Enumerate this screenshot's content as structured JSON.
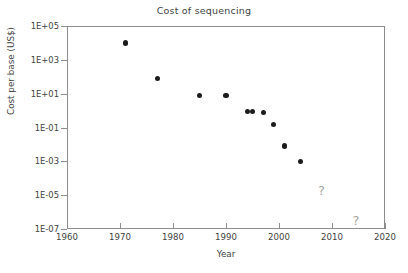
{
  "chart_data": {
    "type": "scatter",
    "title": "Cost of sequencing",
    "xlabel": "Year",
    "ylabel": "Cost per base (US$)",
    "xlim": [
      1960,
      2020
    ],
    "ylim": [
      1e-07,
      100000.0
    ],
    "yscale": "log",
    "grid": false,
    "legend": null,
    "xticks": [
      1960,
      1970,
      1980,
      1990,
      2000,
      2010,
      2020
    ],
    "xtick_labels": [
      "1960",
      "1970",
      "1980",
      "1990",
      "2000",
      "2010",
      "2020"
    ],
    "yticks": [
      100000.0,
      1000.0,
      10.0,
      0.1,
      0.001,
      1e-05,
      1e-07
    ],
    "ytick_labels": [
      "1E+05",
      "1E+03",
      "1E+01",
      "1E-01",
      "1E-03",
      "1E-05",
      "1E-07"
    ],
    "x": [
      1971,
      1977,
      1985,
      1990,
      1994,
      1995,
      1997,
      1999,
      2001,
      2004
    ],
    "y": [
      10000,
      80,
      8,
      8,
      0.9,
      0.9,
      0.8,
      0.15,
      0.008,
      0.001
    ],
    "points": [
      {
        "x": 1971,
        "y": 10000
      },
      {
        "x": 1977,
        "y": 80
      },
      {
        "x": 1985,
        "y": 8
      },
      {
        "x": 1990,
        "y": 8
      },
      {
        "x": 1994,
        "y": 0.9
      },
      {
        "x": 1995,
        "y": 0.9
      },
      {
        "x": 1997,
        "y": 0.8
      },
      {
        "x": 1999,
        "y": 0.15
      },
      {
        "x": 2001,
        "y": 0.008
      },
      {
        "x": 2004,
        "y": 0.001
      }
    ],
    "annotations": [
      {
        "text": "?",
        "x": 2008,
        "y": 2e-05
      },
      {
        "text": "?",
        "x": 2014.5,
        "y": 3.5e-07
      }
    ],
    "marker_color": "#1c1c1c",
    "axis_color": "#8d8d8d",
    "text_color": "#3f3f3f",
    "annotation_color": "#a5a5a5"
  }
}
